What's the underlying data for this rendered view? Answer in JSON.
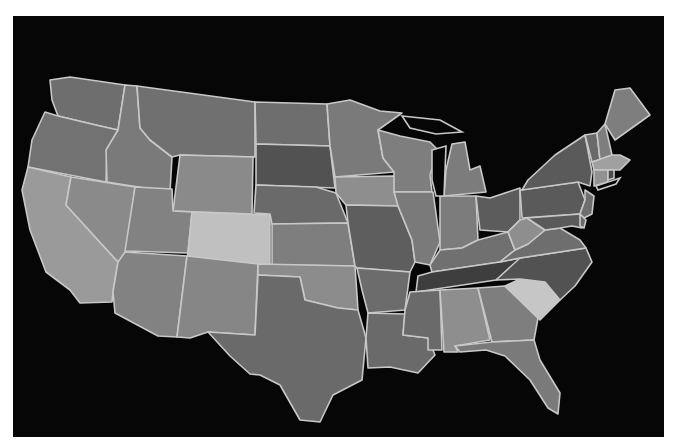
{
  "map": {
    "title": "",
    "background": "#060606",
    "frame_background": "#ffffff",
    "border_color": "#c8c8c8",
    "states": [
      {
        "id": "WA",
        "name": "Washington",
        "fill": "#6e6e6e",
        "points": "50,80 70,77 125,85 118,130 100,126 58,116 52,100"
      },
      {
        "id": "OR",
        "name": "Oregon",
        "fill": "#727272",
        "points": "45,112 58,116 100,126 118,130 107,150 106,182 28,167 32,140"
      },
      {
        "id": "CA",
        "name": "California",
        "fill": "#9a9a9a",
        "points": "28,167 71,177 66,205 118,262 113,292 112,302 80,303 70,290 46,272 30,230 22,190"
      },
      {
        "id": "NV",
        "name": "Nevada",
        "fill": "#8a8a8a",
        "points": "71,177 135,187 125,262 118,262 66,205"
      },
      {
        "id": "ID",
        "name": "Idaho",
        "fill": "#7a7a7a",
        "points": "125,85 137,86 140,128 150,140 172,157 170,192 107,182 106,150 118,130"
      },
      {
        "id": "MT",
        "name": "Montana",
        "fill": "#707070",
        "points": "137,86 255,102 255,157 180,155 172,157 150,140 140,128"
      },
      {
        "id": "WY",
        "name": "Wyoming",
        "fill": "#8a8a8a",
        "points": "180,155 253,157 252,214 173,211"
      },
      {
        "id": "UT",
        "name": "Utah",
        "fill": "#828282",
        "points": "135,187 172,189 173,211 192,212 188,253 125,251"
      },
      {
        "id": "CO",
        "name": "Colorado",
        "fill": "#c0c0c0",
        "points": "192,212 270,215 270,265 187,262"
      },
      {
        "id": "AZ",
        "name": "Arizona",
        "fill": "#828282",
        "points": "125,252 187,256 177,337 158,336 115,313 113,292 118,262"
      },
      {
        "id": "NM",
        "name": "New Mexico",
        "fill": "#868686",
        "points": "187,256 258,264 255,335 208,332 190,338 177,337"
      },
      {
        "id": "ND",
        "name": "North Dakota",
        "fill": "#6e6e6e",
        "points": "255,102 327,104 330,146 256,144"
      },
      {
        "id": "SD",
        "name": "South Dakota",
        "fill": "#525252",
        "points": "256,144 330,146 335,188 256,185"
      },
      {
        "id": "NE",
        "name": "Nebraska",
        "fill": "#6a6a6a",
        "points": "256,185 316,187 336,193 348,223 272,224 270,214 254,213"
      },
      {
        "id": "KS",
        "name": "Kansas",
        "fill": "#7e7e7e",
        "points": "272,224 348,223 355,266 272,265"
      },
      {
        "id": "OK",
        "name": "Oklahoma",
        "fill": "#8c8c8c",
        "points": "258,264 355,266 358,310 338,308 305,300 300,277 258,275"
      },
      {
        "id": "TX",
        "name": "Texas",
        "fill": "#6a6a6a",
        "points": "258,275 300,277 305,300 338,308 358,310 366,338 362,380 333,395 320,422 300,420 280,385 260,375 250,374 230,356 208,332 255,335"
      },
      {
        "id": "MN",
        "name": "Minnesota",
        "fill": "#7a7a7a",
        "points": "327,104 350,100 380,111 402,113 378,130 383,158 394,172 335,177 330,146"
      },
      {
        "id": "IA",
        "name": "Iowa",
        "fill": "#8e8e8e",
        "points": "335,177 394,176 404,190 398,206 346,205 336,193"
      },
      {
        "id": "MO",
        "name": "Missouri",
        "fill": "#5e5e5e",
        "points": "346,205 398,206 412,240 415,262 410,272 357,268 355,266 348,223"
      },
      {
        "id": "AR",
        "name": "Arkansas",
        "fill": "#6c6c6c",
        "points": "357,268 410,272 405,310 368,313 362,290"
      },
      {
        "id": "LA",
        "name": "Louisiana",
        "fill": "#6a6a6a",
        "points": "368,313 405,314 403,335 428,338 435,355 418,373 390,367 368,368 366,338"
      },
      {
        "id": "WI",
        "name": "Wisconsin",
        "fill": "#7e7e7e",
        "points": "378,130 400,136 430,142 438,150 430,175 432,192 394,192 394,172 383,158"
      },
      {
        "id": "IL",
        "name": "Illinois",
        "fill": "#7a7a7a",
        "points": "394,192 433,192 440,242 430,265 415,262 412,240 398,206"
      },
      {
        "id": "MI",
        "name": "Michigan",
        "fill": "#7c7c7c",
        "points": "452,144 465,142 470,170 480,166 486,192 444,196 446,170"
      },
      {
        "id": "IN",
        "name": "Indiana",
        "fill": "#7c7c7c",
        "points": "440,196 476,196 478,240 462,248 440,250"
      },
      {
        "id": "OH",
        "name": "Ohio",
        "fill": "#5c5c5c",
        "points": "476,196 490,198 520,188 520,220 508,232 480,230 478,214"
      },
      {
        "id": "KY",
        "name": "Kentucky",
        "fill": "#707070",
        "points": "430,265 440,250 462,248 478,240 508,232 515,250 500,262 432,272"
      },
      {
        "id": "TN",
        "name": "Tennessee",
        "fill": "#3e3e3e",
        "points": "418,276 432,272 500,262 520,258 515,268 496,280 416,292"
      },
      {
        "id": "MS",
        "name": "Mississippi",
        "fill": "#6a6a6a",
        "points": "410,292 440,290 442,350 428,350 428,338 403,335 405,310"
      },
      {
        "id": "AL",
        "name": "Alabama",
        "fill": "#8e8e8e",
        "points": "440,290 478,288 490,340 455,346 458,352 444,352"
      },
      {
        "id": "GA",
        "name": "Georgia",
        "fill": "#7e7e7e",
        "points": "478,288 505,286 538,318 534,340 492,342"
      },
      {
        "id": "FL",
        "name": "Florida",
        "fill": "#7a7a7a",
        "points": "455,346 492,342 534,340 540,360 560,393 558,414 548,408 530,380 505,356 486,350 460,352"
      },
      {
        "id": "SC",
        "name": "South Carolina",
        "fill": "#c6c6c6",
        "points": "505,286 520,279 545,282 560,300 540,320 538,318"
      },
      {
        "id": "NC",
        "name": "North Carolina",
        "fill": "#525252",
        "points": "496,280 520,258 586,248 592,262 575,286 560,300 545,282 520,279"
      },
      {
        "id": "VA",
        "name": "Virginia",
        "fill": "#6e6e6e",
        "points": "500,262 515,250 528,244 545,230 560,228 580,240 586,248 520,258"
      },
      {
        "id": "WV",
        "name": "West Virginia",
        "fill": "#8e8e8e",
        "points": "508,232 520,220 527,218 545,230 528,244 515,250"
      },
      {
        "id": "PA",
        "name": "Pennsylvania",
        "fill": "#5a5a5a",
        "points": "520,190 578,182 585,200 580,214 522,218"
      },
      {
        "id": "NY",
        "name": "New York",
        "fill": "#5a5a5a",
        "points": "528,180 555,155 585,135 592,172 590,186 578,182 522,190"
      },
      {
        "id": "NJ",
        "name": "New Jersey",
        "fill": "#6e6e6e",
        "points": "585,190 594,196 592,214 584,218 580,214 585,200"
      },
      {
        "id": "MD",
        "name": "Maryland",
        "fill": "#5a5a5a",
        "points": "527,218 580,214 582,228 572,226 560,228 545,230"
      },
      {
        "id": "DE",
        "name": "Delaware",
        "fill": "#6a6a6a",
        "points": "580,214 586,220 584,228 580,226"
      },
      {
        "id": "VT",
        "name": "Vermont",
        "fill": "#6a6a6a",
        "points": "585,135 597,133 600,160 592,162"
      },
      {
        "id": "NH",
        "name": "New Hampshire",
        "fill": "#7e7e7e",
        "points": "597,133 605,124 612,155 600,160"
      },
      {
        "id": "ME",
        "name": "Maine",
        "fill": "#7e7e7e",
        "points": "605,124 615,90 630,88 650,115 615,140"
      },
      {
        "id": "MA",
        "name": "Massachusetts",
        "fill": "#a0a0a0",
        "points": "592,162 612,155 620,155 630,160 620,170 594,170"
      },
      {
        "id": "CT",
        "name": "Connecticut",
        "fill": "#929292",
        "points": "594,170 608,170 608,182 594,186"
      },
      {
        "id": "RI",
        "name": "Rhode Island",
        "fill": "#4a4a4a",
        "points": "608,170 614,170 614,178 608,180"
      }
    ],
    "lakes": [
      {
        "id": "lake-michigan",
        "name": "Lake Michigan",
        "points": "432,150 446,146 444,196 436,196 432,180"
      },
      {
        "id": "lake-superior",
        "name": "Lake Superior",
        "points": "402,116 440,120 462,132 436,134 410,128"
      },
      {
        "id": "long-island-sound",
        "name": "Long Island",
        "points": "596,186 620,178 616,184 598,190"
      }
    ]
  }
}
